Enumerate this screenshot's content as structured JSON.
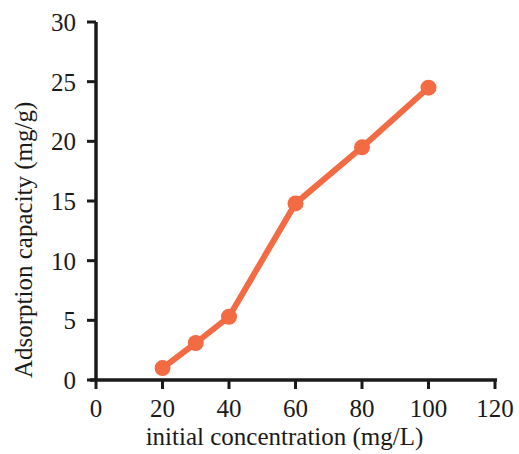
{
  "chart_data": {
    "type": "line",
    "title": "",
    "xlabel": "initial concentration (mg/L)",
    "ylabel": "Adsorption capacity (mg/g)",
    "x": [
      20,
      30,
      40,
      60,
      80,
      100
    ],
    "values": [
      1.0,
      3.1,
      5.3,
      14.8,
      19.5,
      24.5
    ],
    "series": [
      {
        "name": "Adsorption capacity",
        "x": [
          20,
          30,
          40,
          60,
          80,
          100
        ],
        "values": [
          1.0,
          3.1,
          5.3,
          14.8,
          19.5,
          24.5
        ],
        "color": "#F26B43",
        "marker": "circle",
        "line_style": "solid"
      }
    ],
    "xlim": [
      0,
      120
    ],
    "ylim": [
      0,
      30
    ],
    "xticks": [
      0,
      20,
      40,
      60,
      80,
      100,
      120
    ],
    "yticks": [
      0,
      5,
      10,
      15,
      20,
      25,
      30
    ],
    "xtick_labels": [
      "0",
      "20",
      "40",
      "60",
      "80",
      "100",
      "120"
    ],
    "ytick_labels": [
      "0",
      "5",
      "10",
      "15",
      "20",
      "25",
      "30"
    ],
    "grid": false,
    "legend": null,
    "legend_position": "none",
    "annotations": []
  },
  "style": {
    "series_color": "#F26B43",
    "axis_color": "#1a1a1a",
    "background": "#ffffff",
    "line_width": 6,
    "marker_size": 16
  },
  "geometry": {
    "plot_left": 96,
    "plot_right": 495,
    "plot_top": 22,
    "plot_bottom": 380
  }
}
